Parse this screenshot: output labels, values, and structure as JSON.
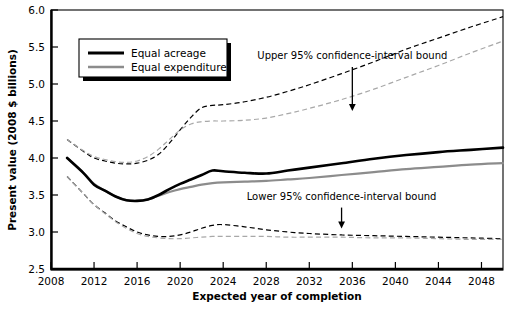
{
  "chart_data": {
    "type": "line",
    "title": "",
    "xlabel": "Expected year of completion",
    "ylabel": "Present value (2008 $ billions)",
    "xlim": [
      2008,
      2050
    ],
    "ylim": [
      2.5,
      6.0
    ],
    "grid": false,
    "x_ticks": [
      "2008",
      "2012",
      "2016",
      "2020",
      "2024",
      "2028",
      "2032",
      "2036",
      "2040",
      "2044",
      "2048"
    ],
    "x_tick_values": [
      2008,
      2012,
      2016,
      2020,
      2024,
      2028,
      2032,
      2036,
      2040,
      2044,
      2048
    ],
    "y_ticks": [
      "2.5",
      "3.0",
      "3.5",
      "4.0",
      "4.5",
      "5.0",
      "5.5",
      "6.0"
    ],
    "y_tick_values": [
      2.5,
      3.0,
      3.5,
      4.0,
      4.5,
      5.0,
      5.5,
      6.0
    ],
    "legend_position": "upper-left",
    "x": [
      2009.5,
      2011,
      2012,
      2013,
      2014,
      2015,
      2016,
      2017,
      2018,
      2019,
      2020,
      2021,
      2022,
      2023,
      2024,
      2026,
      2028,
      2030,
      2032,
      2035,
      2038,
      2041,
      2044,
      2047,
      2050
    ],
    "series": [
      {
        "name": "Equal acreage",
        "style": "solid-black",
        "color": "#000000",
        "values": [
          4.0,
          3.8,
          3.64,
          3.56,
          3.48,
          3.43,
          3.42,
          3.44,
          3.5,
          3.58,
          3.65,
          3.71,
          3.77,
          3.83,
          3.82,
          3.8,
          3.79,
          3.83,
          3.87,
          3.93,
          3.99,
          4.04,
          4.08,
          4.11,
          4.14
        ]
      },
      {
        "name": "Equal expenditure",
        "style": "solid-gray",
        "color": "#8c8c8c",
        "values": [
          4.0,
          3.8,
          3.65,
          3.56,
          3.48,
          3.43,
          3.42,
          3.44,
          3.49,
          3.54,
          3.58,
          3.61,
          3.64,
          3.66,
          3.67,
          3.68,
          3.69,
          3.71,
          3.73,
          3.77,
          3.81,
          3.85,
          3.88,
          3.91,
          3.93
        ]
      },
      {
        "name": "Equal acreage upper 95% bound",
        "style": "dashed-black",
        "color": "#000000",
        "values": [
          4.25,
          4.09,
          4.0,
          3.96,
          3.93,
          3.92,
          3.93,
          3.97,
          4.05,
          4.2,
          4.38,
          4.55,
          4.68,
          4.71,
          4.72,
          4.76,
          4.82,
          4.9,
          4.99,
          5.14,
          5.3,
          5.47,
          5.62,
          5.77,
          5.91
        ]
      },
      {
        "name": "Equal expenditure upper 95% bound",
        "style": "dashed-gray",
        "color": "#a8a8a8",
        "values": [
          4.25,
          4.1,
          4.02,
          3.98,
          3.95,
          3.94,
          3.96,
          4.02,
          4.12,
          4.25,
          4.38,
          4.46,
          4.49,
          4.5,
          4.5,
          4.51,
          4.54,
          4.6,
          4.67,
          4.79,
          4.93,
          5.09,
          5.25,
          5.42,
          5.58
        ]
      },
      {
        "name": "Equal acreage lower 95% bound",
        "style": "dashed-black",
        "color": "#000000",
        "values": [
          3.75,
          3.52,
          3.37,
          3.26,
          3.15,
          3.07,
          3.0,
          2.96,
          2.94,
          2.94,
          2.96,
          3.0,
          3.05,
          3.09,
          3.1,
          3.07,
          3.03,
          3.0,
          2.98,
          2.96,
          2.95,
          2.94,
          2.93,
          2.92,
          2.91
        ]
      },
      {
        "name": "Equal expenditure lower 95% bound",
        "style": "dashed-gray",
        "color": "#a8a8a8",
        "values": [
          3.75,
          3.52,
          3.37,
          3.25,
          3.14,
          3.05,
          2.98,
          2.94,
          2.92,
          2.91,
          2.91,
          2.92,
          2.93,
          2.94,
          2.94,
          2.94,
          2.94,
          2.93,
          2.93,
          2.93,
          2.92,
          2.92,
          2.91,
          2.9,
          2.9
        ]
      }
    ],
    "legend": [
      {
        "label": "Equal acreage",
        "color": "#000000",
        "style": "solid-black"
      },
      {
        "label": "Equal expenditure",
        "color": "#8c8c8c",
        "style": "solid-gray"
      }
    ],
    "annotations": [
      {
        "text": "Upper 95% confidence-interval bound",
        "arrow_x": 2036,
        "arrow_y_top": 5.23,
        "arrow_y_tip": 4.65
      },
      {
        "text": "Lower 95% confidence-interval bound",
        "arrow_x": 2035,
        "arrow_y_top": 3.33,
        "arrow_y_tip": 3.06
      }
    ]
  }
}
